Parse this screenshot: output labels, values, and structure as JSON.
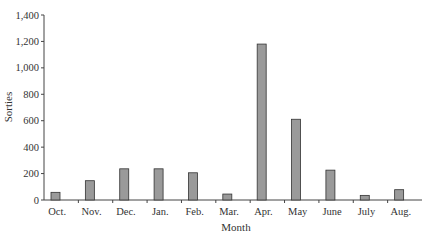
{
  "chart_data": {
    "type": "bar",
    "title": "",
    "xlabel": "Month",
    "ylabel": "Sorties",
    "categories": [
      "Oct.",
      "Nov.",
      "Dec.",
      "Jan.",
      "Feb.",
      "Mar.",
      "Apr.",
      "May",
      "June",
      "July",
      "Aug."
    ],
    "values": [
      58,
      146,
      236,
      236,
      206,
      45,
      1180,
      611,
      226,
      35,
      78
    ],
    "ylim": [
      0,
      1400
    ],
    "yticks": [
      0,
      200,
      400,
      600,
      800,
      1000,
      1200,
      1400
    ],
    "ytick_labels": [
      "0",
      "200",
      "400",
      "600",
      "800",
      "1,000",
      "1,200",
      "1,400"
    ],
    "grid": false,
    "legend": null,
    "bar_color": "#9a9a9a",
    "bar_edge_color": "#333333"
  }
}
